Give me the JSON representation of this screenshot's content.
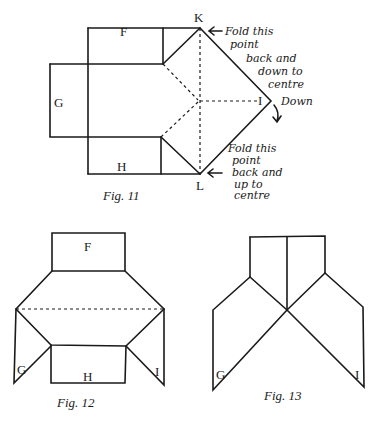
{
  "figures": [
    {
      "id": "fig11",
      "caption": "Fig. 11",
      "labels": {
        "top": "F",
        "left": "G",
        "bottom": "H",
        "right": "I",
        "k": "K",
        "l": "L"
      },
      "annotations": {
        "k_line1": "Fold this",
        "k_line2": "point",
        "k_line3": "back and",
        "k_line4": "down to",
        "k_line5": "centre",
        "i_note": "Down",
        "l_line1": "Fold this",
        "l_line2": "point",
        "l_line3": "back and",
        "l_line4": "up to",
        "l_line5": "centre"
      }
    },
    {
      "id": "fig12",
      "caption": "Fig. 12",
      "labels": {
        "top": "F",
        "left": "G",
        "bottom": "H",
        "right": "I"
      }
    },
    {
      "id": "fig13",
      "caption": "Fig. 13",
      "labels": {
        "left": "G",
        "right": "I"
      }
    }
  ],
  "colors": {
    "ink": "#1a1a1a",
    "paper": "#ffffff"
  }
}
